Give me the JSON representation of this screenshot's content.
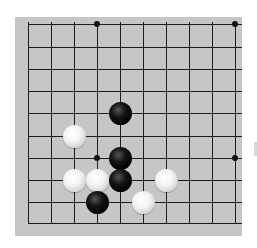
{
  "board": {
    "description": "Go board fragment, 10x10 visible intersections",
    "background": "#c6c6c6",
    "line_color": "#1e1e1e",
    "columns_x": [
      28,
      51,
      74,
      97,
      120,
      143,
      166,
      189,
      212,
      235
    ],
    "rows_y": [
      24,
      47,
      69,
      91,
      113,
      136,
      158,
      180,
      202,
      223
    ],
    "star_points": [
      {
        "col": 3,
        "row": 0
      },
      {
        "col": 9,
        "row": 0
      },
      {
        "col": 3,
        "row": 6
      },
      {
        "col": 9,
        "row": 6
      }
    ],
    "stones": [
      {
        "color": "black",
        "col": 4,
        "row": 4
      },
      {
        "color": "white",
        "col": 2,
        "row": 5
      },
      {
        "color": "black",
        "col": 4,
        "row": 6
      },
      {
        "color": "white",
        "col": 2,
        "row": 7
      },
      {
        "color": "white",
        "col": 3,
        "row": 7
      },
      {
        "color": "black",
        "col": 4,
        "row": 7
      },
      {
        "color": "white",
        "col": 6,
        "row": 7
      },
      {
        "color": "black",
        "col": 3,
        "row": 8
      },
      {
        "color": "white",
        "col": 5,
        "row": 8
      }
    ]
  }
}
